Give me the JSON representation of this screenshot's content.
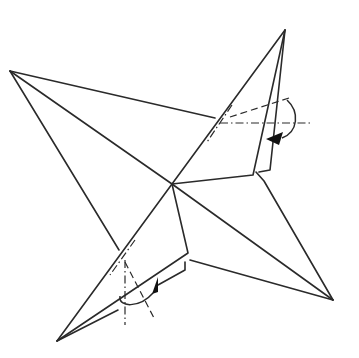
{
  "diagram": {
    "title": "",
    "type": "origami-fold-diagram",
    "colors": {
      "line": "#2a2a2a",
      "background": "#ffffff",
      "arrowhead": "#111111"
    },
    "points": {
      "left_tip": [
        10,
        71
      ],
      "center": [
        172,
        184
      ],
      "top_tip": [
        285,
        30
      ],
      "right_tip": [
        333,
        300
      ],
      "bottom_left_tip": [
        57,
        341
      ]
    },
    "annotations": [
      {
        "kind": "valley-fold-line",
        "location": "upper-right flap"
      },
      {
        "kind": "mountain-fold-line",
        "location": "upper-right flap"
      },
      {
        "kind": "fold-arrow",
        "location": "upper-right flap",
        "direction": "clockwise-down"
      },
      {
        "kind": "valley-fold-line",
        "location": "lower-left flap"
      },
      {
        "kind": "mountain-fold-line",
        "location": "lower-left flap"
      },
      {
        "kind": "fold-arrow",
        "location": "lower-left flap",
        "direction": "counterclockwise-up"
      }
    ]
  }
}
